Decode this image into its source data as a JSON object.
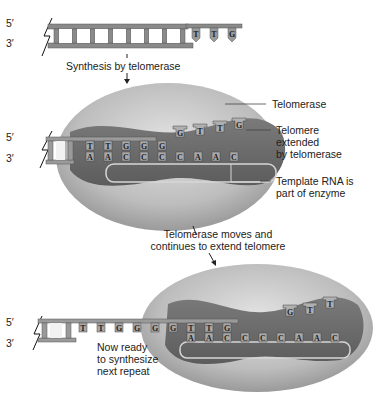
{
  "stage1": {
    "five_prime": "5′",
    "three_prime": "3′",
    "overhang_bases": [
      "T",
      "T",
      "G"
    ]
  },
  "arrow1_label": "Synthesis by telomerase",
  "stage2": {
    "five_prime": "5′",
    "three_prime": "3′",
    "dna_top_bases": [
      "T",
      "T",
      "G",
      "G",
      "G"
    ],
    "rna_bases": [
      "A",
      "A",
      "C",
      "C",
      "C",
      "C",
      "A",
      "A",
      "C"
    ],
    "new_bases": [
      "G",
      "T",
      "T",
      "G"
    ],
    "callouts": {
      "telomerase": "Telomerase",
      "telomere_extended": "Telomere\nextended\nby telomerase",
      "template_rna": "Template RNA is\npart of enzyme"
    }
  },
  "arrow2_label": "Telomerase moves and\ncontinues to extend telomere",
  "stage3": {
    "five_prime": "5′",
    "three_prime": "3′",
    "dna_top_bases": [
      "T",
      "T",
      "G",
      "G",
      "G",
      "G",
      "T",
      "T",
      "G"
    ],
    "rna_bases": [
      "A",
      "A",
      "C",
      "C",
      "C",
      "C",
      "A",
      "A",
      "C"
    ],
    "free_bases": [
      "G",
      "T",
      "T"
    ],
    "note": "Now ready\nto synthesize\nnext repeat"
  },
  "colors": {
    "dna": "#8a8a8a",
    "enzyme_outer": "#c8c8c8",
    "enzyme_inner": "#6e6e6e",
    "rna_loop": "#d6d6d6"
  }
}
